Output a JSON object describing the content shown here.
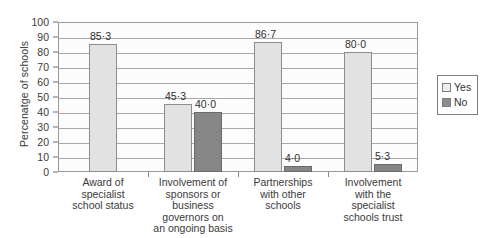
{
  "chart_data": {
    "type": "bar",
    "title": "",
    "subtitle": "",
    "xlabel": "",
    "ylabel": "Percenatge of schools",
    "ylim": [
      0,
      100
    ],
    "ytick_step": 10,
    "yticks": [
      "100",
      "90",
      "80",
      "70",
      "60",
      "50",
      "40",
      "30",
      "20",
      "10",
      "0"
    ],
    "grid": true,
    "legend_position": "right",
    "decimal_separator": "middle-dot",
    "categories": [
      "Award of specialist school status",
      "Involvement of sponsors or business governors on an ongoing basis",
      "Partnerships with other schools",
      "Involvement with the specialist schools trust"
    ],
    "category_lines": [
      [
        "Award of",
        "specialist",
        "school status"
      ],
      [
        "Involvement of",
        "sponsors or",
        "business",
        "governors on",
        "an ongoing basis"
      ],
      [
        "Partnerships",
        "with other",
        "schools"
      ],
      [
        "Involvement",
        "with the",
        "specialist",
        "schools trust"
      ]
    ],
    "series": [
      {
        "name": "Yes",
        "color": "#e2e2e2",
        "values": [
          85.3,
          45.3,
          86.7,
          80.0
        ],
        "labels": [
          "85·3",
          "45·3",
          "86·7",
          "80·0"
        ]
      },
      {
        "name": "No",
        "color": "#868686",
        "values": [
          null,
          40.0,
          4.0,
          5.3
        ],
        "labels": [
          null,
          "40·0",
          "4·0",
          "5·3"
        ]
      }
    ]
  },
  "legend": {
    "items": [
      {
        "label": "Yes",
        "color": "#e2e2e2"
      },
      {
        "label": "No",
        "color": "#868686"
      }
    ]
  },
  "axis": {
    "y_title": "Percenatge of schools"
  }
}
